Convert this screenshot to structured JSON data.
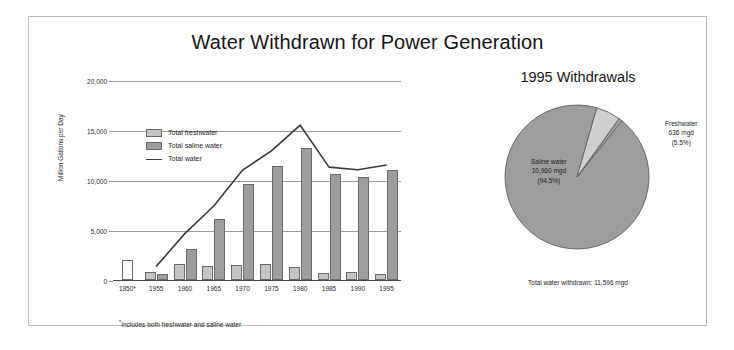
{
  "figure": {
    "title": "Water Withdrawn for Power Generation",
    "footnote_marker": "*",
    "footnote": "Includes both freshwater and saline water"
  },
  "bar_chart": {
    "ylabel": "Million Gallons per Day",
    "ytick_labels": [
      "0",
      "5,000",
      "10,000",
      "15,000",
      "20,000"
    ],
    "legend": [
      {
        "label": "Total freshwater",
        "swatch": "fresh"
      },
      {
        "label": "Total saline water",
        "swatch": "saline"
      },
      {
        "label": "Total water",
        "swatch": "line"
      }
    ]
  },
  "pie_chart": {
    "title": "1995 Withdrawals",
    "saline_label_line1": "Saline water",
    "saline_label_line2": "10,960 mgd",
    "saline_label_line3": "(94.5%)",
    "fresh_label_line1": "Freshwater",
    "fresh_label_line2": "636 mgd",
    "fresh_label_line3": "(5.5%)",
    "total_text": "Total water withdrawn:  11,596 mgd"
  },
  "colors": {
    "freshwater": "#c4c4c4",
    "saline": "#9d9d9d",
    "combined": "#ffffff",
    "line": "#3a3a3a",
    "grid": "#9a9a9a",
    "border": "#b9b9b9"
  },
  "chart_data": [
    {
      "type": "bar",
      "title": "Water Withdrawn for Power Generation",
      "xlabel": "",
      "ylabel": "Million Gallons per Day",
      "ylim": [
        0,
        20000
      ],
      "yticks": [
        0,
        5000,
        10000,
        15000,
        20000
      ],
      "grid": true,
      "legend_position": "upper-left-inside",
      "categories": [
        "1950*",
        "1955",
        "1960",
        "1965",
        "1970",
        "1975",
        "1980",
        "1985",
        "1990",
        "1995"
      ],
      "series": [
        {
          "name": "Total freshwater",
          "type": "bar",
          "values": [
            null,
            840,
            1620,
            1380,
            1490,
            1560,
            1330,
            740,
            840,
            636
          ]
        },
        {
          "name": "Total saline water",
          "type": "bar",
          "values": [
            null,
            620,
            3140,
            6120,
            9600,
            11450,
            13250,
            10650,
            10280,
            10960
          ]
        },
        {
          "name": "Total (freshwater and saline water combined)",
          "type": "bar",
          "note": "1950 only; shown as an unfilled white bar",
          "values": [
            2000,
            null,
            null,
            null,
            null,
            null,
            null,
            null,
            null,
            null
          ]
        },
        {
          "name": "Total water",
          "type": "line",
          "values": [
            null,
            1460,
            4760,
            7500,
            11090,
            13010,
            15580,
            11390,
            11120,
            11596
          ]
        }
      ]
    },
    {
      "type": "pie",
      "title": "1995 Withdrawals",
      "labels": [
        "Saline water",
        "Freshwater"
      ],
      "values": [
        10960,
        636
      ],
      "percentages": [
        94.5,
        5.5
      ],
      "units": "mgd",
      "annotation": "Total water withdrawn:  11,596 mgd"
    }
  ]
}
